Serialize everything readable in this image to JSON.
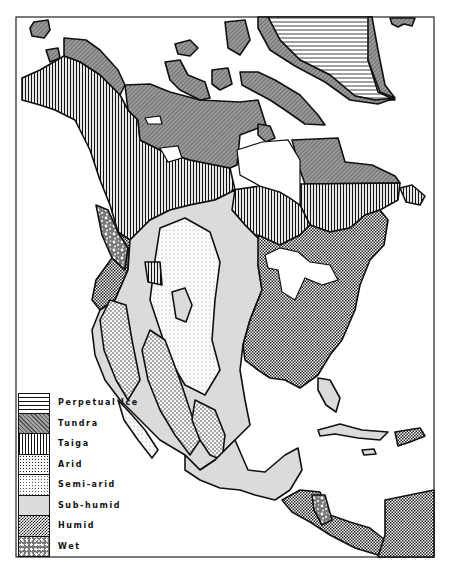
{
  "map": {
    "subject": "North America climate regions",
    "legend": [
      {
        "key": "perpetual_ice",
        "label": "Perpetual Ice",
        "pattern": "horizontal-lines"
      },
      {
        "key": "tundra",
        "label": "Tundra",
        "pattern": "dense-diagonal-gray"
      },
      {
        "key": "taiga",
        "label": "Taiga",
        "pattern": "vertical-lines"
      },
      {
        "key": "arid",
        "label": "Arid",
        "pattern": "medium-dots"
      },
      {
        "key": "semi_arid",
        "label": "Semi-arid",
        "pattern": "fine-dots"
      },
      {
        "key": "sub_humid",
        "label": "Sub-humid",
        "pattern": "light-gray-stipple"
      },
      {
        "key": "humid",
        "label": "Humid",
        "pattern": "dark-checker"
      },
      {
        "key": "wet",
        "label": "Wet",
        "pattern": "mottled"
      }
    ],
    "colors": {
      "ink": "#111111",
      "paper": "#ffffff",
      "tundra_fill": "#8a8a8a",
      "sub_humid_fill": "#dcdcdc",
      "humid_fill": "#555555"
    }
  }
}
